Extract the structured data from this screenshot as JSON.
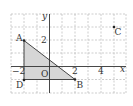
{
  "figure": {
    "axes": {
      "x_label": "x",
      "y_label": "y",
      "origin_label": "O",
      "tick_labels": {
        "x": [
          {
            "value": -2,
            "text": "−2"
          },
          {
            "value": 2,
            "text": "2"
          },
          {
            "value": 4,
            "text": "4"
          }
        ],
        "y": [
          {
            "value": 2,
            "text": "2"
          }
        ]
      },
      "x_range": [
        -3,
        6
      ],
      "y_range": [
        -2,
        4
      ],
      "grid": "dashed, unit spacing"
    },
    "points": [
      {
        "name": "A",
        "x": -2,
        "y": 2
      },
      {
        "name": "B",
        "x": 2,
        "y": -1
      },
      {
        "name": "C",
        "x": 5,
        "y": 3
      },
      {
        "name": "D",
        "x": -2,
        "y": -1
      }
    ],
    "shaded_triangle": [
      "A",
      "B",
      "D"
    ],
    "colors": {
      "grid": "#b8b8b8",
      "axis": "#333333",
      "shade": "#d6d6d6",
      "line": "#333333"
    }
  }
}
